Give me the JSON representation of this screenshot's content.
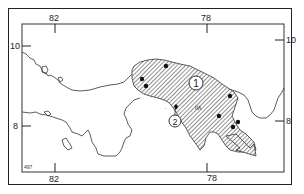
{
  "map": {
    "title": "",
    "region": "Panama",
    "axes": {
      "longitude_ticks": [
        {
          "label": "82",
          "x": 55
        },
        {
          "label": "78",
          "x": 207
        }
      ],
      "latitude_ticks": [
        {
          "label": "10",
          "y": 46
        },
        {
          "label": "8",
          "y": 126
        }
      ]
    },
    "labels": {
      "top_lon_left": "82",
      "top_lon_right": "78",
      "bottom_lon_left": "82",
      "bottom_lon_right": "78",
      "left_lat_top": "10",
      "left_lat_bottom": "8",
      "right_lat_top": "10",
      "right_lat_bottom": "8",
      "corner_code": "497"
    },
    "range_areas": [
      {
        "id": "1",
        "label": "1",
        "style": "hatched"
      },
      {
        "id": "2",
        "label": "2",
        "style": "point-island"
      }
    ],
    "colors": {
      "ink": "#222222",
      "hatch": "#555555",
      "background": "#ffffff"
    }
  }
}
